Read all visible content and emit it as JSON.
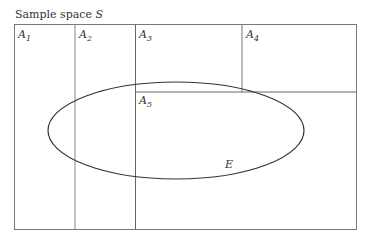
{
  "title": "Sample space ",
  "title_symbol": "S",
  "partitions": [
    {
      "name": "A",
      "sub": "1"
    },
    {
      "name": "A",
      "sub": "2"
    },
    {
      "name": "A",
      "sub": "3"
    },
    {
      "name": "A",
      "sub": "4"
    },
    {
      "name": "A",
      "sub": "5"
    }
  ],
  "event_label": "E"
}
